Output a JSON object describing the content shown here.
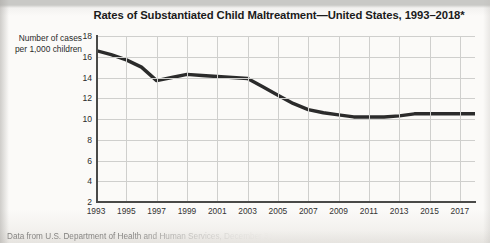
{
  "figure": {
    "title": "Rates of Substantiated Child Maltreatment—United States, 1993–2018*",
    "source_note": "Data from U.S. Department of Health and Human Services, December 31, 2020"
  },
  "chart_data": {
    "type": "line",
    "title": "Rates of Substantiated Child Maltreatment—United States, 1993–2018*",
    "xlabel": "",
    "ylabel": "Number of cases per 1,000 children",
    "ylabel_lines": [
      "Number of cases",
      "per 1,000 children"
    ],
    "xlim": [
      1993,
      2018
    ],
    "ylim": [
      2,
      18
    ],
    "ytick_labels": [
      "18",
      "16",
      "14",
      "12",
      "10",
      "8",
      "6",
      "4",
      "2"
    ],
    "yticks": [
      18,
      16,
      14,
      12,
      10,
      8,
      6,
      4,
      2
    ],
    "xtick_labels": [
      "1993",
      "1995",
      "1997",
      "1999",
      "2001",
      "2003",
      "2005",
      "2007",
      "2009",
      "2011",
      "2013",
      "2015",
      "2017"
    ],
    "xticks": [
      1993,
      1995,
      1997,
      1999,
      2001,
      2003,
      2005,
      2007,
      2009,
      2011,
      2013,
      2015,
      2017
    ],
    "grid": true,
    "legend": false,
    "line_color": "#2b2b2b",
    "line_width": 3.4,
    "x": [
      1993,
      1994,
      1995,
      1996,
      1997,
      1998,
      1999,
      2000,
      2001,
      2002,
      2003,
      2004,
      2005,
      2006,
      2007,
      2008,
      2009,
      2010,
      2011,
      2012,
      2013,
      2014,
      2015,
      2016,
      2017,
      2018
    ],
    "values": [
      16.6,
      16.2,
      15.7,
      15.0,
      13.7,
      14.0,
      14.3,
      14.2,
      14.1,
      14.0,
      13.9,
      13.1,
      12.3,
      11.5,
      10.9,
      10.6,
      10.4,
      10.2,
      10.2,
      10.2,
      10.3,
      10.5,
      10.5,
      10.5,
      10.5,
      10.5
    ],
    "series": [
      {
        "name": "Substantiated child maltreatment rate",
        "values": [
          16.6,
          16.2,
          15.7,
          15.0,
          13.7,
          14.0,
          14.3,
          14.2,
          14.1,
          14.0,
          13.9,
          13.1,
          12.3,
          11.5,
          10.9,
          10.6,
          10.4,
          10.2,
          10.2,
          10.2,
          10.3,
          10.5,
          10.5,
          10.5,
          10.5,
          10.5
        ]
      }
    ]
  }
}
